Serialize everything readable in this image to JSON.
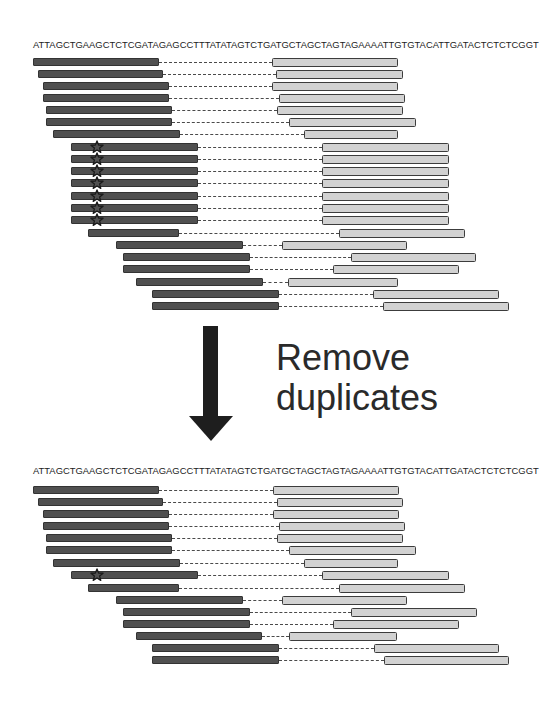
{
  "figure": {
    "reference_sequence": "ATTAGCTGAAGCTCTCGATAGAGCCTTTATATAGTCTGATGCTAGCTAGTAGAAAATTGTGTACATTGATACTCTCTCGGT",
    "transition_label_line1": "Remove",
    "transition_label_line2": "duplicates",
    "colors": {
      "read1": "#505050",
      "read2": "#d2d2d2",
      "outline": "#3c3c3c",
      "insert_dash": "#4a4a4a",
      "arrow": "#1e1e1e",
      "text": "#222222"
    },
    "legend_icons": [
      "star-icon (duplicate marker)",
      "arrow-down-icon"
    ]
  },
  "before": {
    "sequence_y": 40,
    "reads": [
      {
        "y": 58,
        "r1": [
          33,
          159
        ],
        "r2": [
          272,
          398
        ],
        "dup": false
      },
      {
        "y": 70,
        "r1": [
          38,
          163
        ],
        "r2": [
          276,
          403
        ],
        "dup": false
      },
      {
        "y": 82,
        "r1": [
          43,
          169
        ],
        "r2": [
          272,
          398
        ],
        "dup": false
      },
      {
        "y": 94,
        "r1": [
          43,
          169
        ],
        "r2": [
          279,
          405
        ],
        "dup": false
      },
      {
        "y": 106,
        "r1": [
          46,
          172
        ],
        "r2": [
          277,
          403
        ],
        "dup": false
      },
      {
        "y": 118,
        "r1": [
          46,
          172
        ],
        "r2": [
          289,
          416
        ],
        "dup": false
      },
      {
        "y": 130,
        "r1": [
          53,
          180
        ],
        "r2": [
          304,
          398
        ],
        "dup": false
      },
      {
        "y": 143,
        "r1": [
          71,
          198
        ],
        "r2": [
          322,
          449
        ],
        "dup": true
      },
      {
        "y": 155,
        "r1": [
          71,
          198
        ],
        "r2": [
          322,
          449
        ],
        "dup": true
      },
      {
        "y": 167,
        "r1": [
          71,
          198
        ],
        "r2": [
          322,
          449
        ],
        "dup": true
      },
      {
        "y": 179,
        "r1": [
          71,
          198
        ],
        "r2": [
          322,
          449
        ],
        "dup": true
      },
      {
        "y": 192,
        "r1": [
          71,
          198
        ],
        "r2": [
          322,
          449
        ],
        "dup": true
      },
      {
        "y": 204,
        "r1": [
          71,
          198
        ],
        "r2": [
          322,
          449
        ],
        "dup": true
      },
      {
        "y": 216,
        "r1": [
          71,
          198
        ],
        "r2": [
          322,
          449
        ],
        "dup": true
      },
      {
        "y": 229,
        "r1": [
          88,
          179
        ],
        "r2": [
          339,
          465
        ],
        "dup": false
      },
      {
        "y": 241,
        "r1": [
          116,
          243
        ],
        "r2": [
          282,
          407
        ],
        "dup": false
      },
      {
        "y": 253,
        "r1": [
          123,
          250
        ],
        "r2": [
          351,
          476
        ],
        "dup": false
      },
      {
        "y": 265,
        "r1": [
          123,
          250
        ],
        "r2": [
          333,
          459
        ],
        "dup": false
      },
      {
        "y": 278,
        "r1": [
          136,
          263
        ],
        "r2": [
          288,
          398
        ],
        "dup": false
      },
      {
        "y": 290,
        "r1": [
          152,
          279
        ],
        "r2": [
          373,
          499
        ],
        "dup": false
      },
      {
        "y": 302,
        "r1": [
          152,
          279
        ],
        "r2": [
          383,
          509
        ],
        "dup": false
      }
    ]
  },
  "after": {
    "sequence_y": 466,
    "reads": [
      {
        "y": 486,
        "r1": [
          33,
          159
        ],
        "r2": [
          273,
          399
        ],
        "dup": false
      },
      {
        "y": 498,
        "r1": [
          38,
          163
        ],
        "r2": [
          277,
          403
        ],
        "dup": false
      },
      {
        "y": 510,
        "r1": [
          43,
          169
        ],
        "r2": [
          273,
          399
        ],
        "dup": false
      },
      {
        "y": 522,
        "r1": [
          43,
          169
        ],
        "r2": [
          279,
          405
        ],
        "dup": false
      },
      {
        "y": 534,
        "r1": [
          46,
          172
        ],
        "r2": [
          277,
          403
        ],
        "dup": false
      },
      {
        "y": 546,
        "r1": [
          46,
          172
        ],
        "r2": [
          289,
          416
        ],
        "dup": false
      },
      {
        "y": 559,
        "r1": [
          53,
          180
        ],
        "r2": [
          304,
          398
        ],
        "dup": false
      },
      {
        "y": 571,
        "r1": [
          71,
          198
        ],
        "r2": [
          322,
          449
        ],
        "dup": true
      },
      {
        "y": 584,
        "r1": [
          88,
          179
        ],
        "r2": [
          339,
          465
        ],
        "dup": false
      },
      {
        "y": 596,
        "r1": [
          116,
          243
        ],
        "r2": [
          282,
          407
        ],
        "dup": false
      },
      {
        "y": 608,
        "r1": [
          123,
          250
        ],
        "r2": [
          351,
          477
        ],
        "dup": false
      },
      {
        "y": 620,
        "r1": [
          123,
          250
        ],
        "r2": [
          333,
          459
        ],
        "dup": false
      },
      {
        "y": 632,
        "r1": [
          136,
          262
        ],
        "r2": [
          289,
          397
        ],
        "dup": false
      },
      {
        "y": 644,
        "r1": [
          152,
          279
        ],
        "r2": [
          374,
          499
        ],
        "dup": false
      },
      {
        "y": 656,
        "r1": [
          152,
          279
        ],
        "r2": [
          384,
          509
        ],
        "dup": false
      }
    ]
  }
}
